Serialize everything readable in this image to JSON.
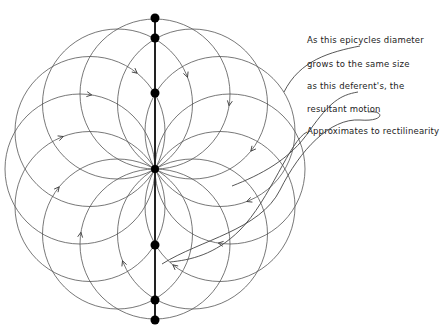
{
  "diagram": {
    "center": [
      155,
      169
    ],
    "deferent_radius": 75,
    "epicycle_radius": 75,
    "circle_count": 12,
    "line_color": "#555555",
    "dot_color": "#000000",
    "dots_y": [
      18,
      38,
      93,
      169,
      245,
      300,
      320
    ],
    "dots_x": 155
  },
  "annotation": {
    "lines": [
      "As this epicycles diameter",
      "grows to the same size",
      "as this deferent's, the",
      "resultant motion",
      "Approximates to rectilinearity"
    ],
    "line_y": [
      41,
      66,
      88,
      111,
      132
    ],
    "x": 307
  }
}
